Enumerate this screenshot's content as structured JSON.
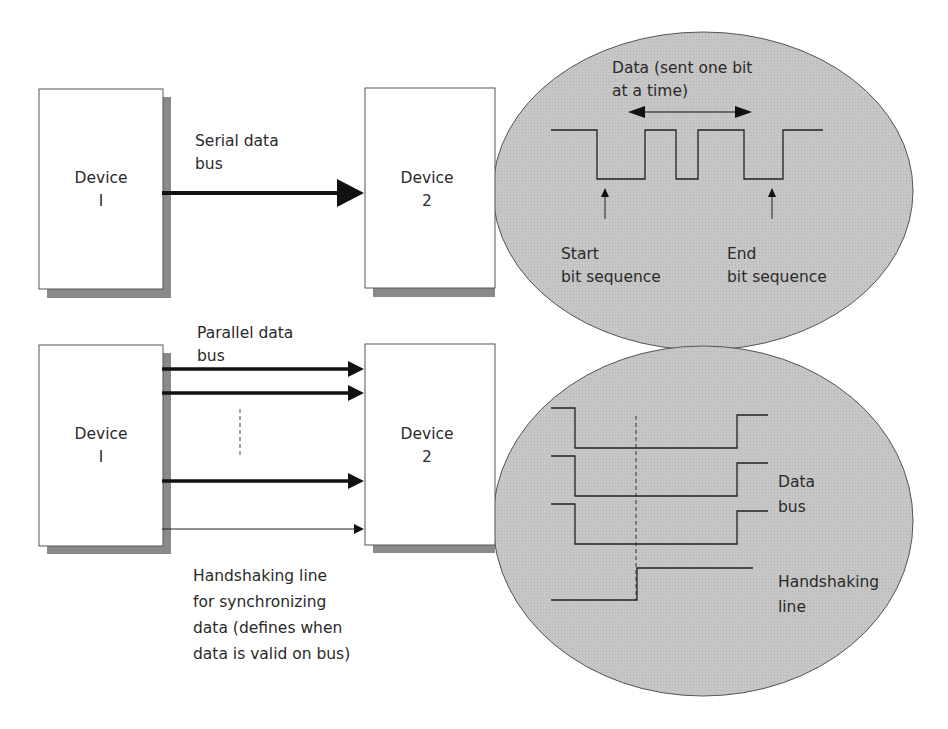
{
  "colors": {
    "ellipse_fill": "#c4c4c4",
    "ellipse_stroke": "#555555",
    "box_fill": "#ffffff",
    "box_stroke": "#555555",
    "shadow": "#888888",
    "line": "#1a1a1a"
  },
  "serial": {
    "device1": {
      "line1": "Device",
      "line2": "I"
    },
    "device2": {
      "line1": "Device",
      "line2": "2"
    },
    "bus_label": {
      "line1": "Serial data",
      "line2": "bus"
    },
    "callout": {
      "data_label": {
        "line1": "Data (sent one bit",
        "line2": "at a time)"
      },
      "start_label": {
        "line1": "Start",
        "line2": "bit sequence"
      },
      "end_label": {
        "line1": "End",
        "line2": "bit sequence"
      }
    }
  },
  "parallel": {
    "device1": {
      "line1": "Device",
      "line2": "I"
    },
    "device2": {
      "line1": "Device",
      "line2": "2"
    },
    "bus_label": {
      "line1": "Parallel data",
      "line2": "bus"
    },
    "handshake_label": {
      "line1": "Handshaking line",
      "line2": "for synchronizing",
      "line3": "data (defines when",
      "line4": "data is valid on bus)"
    },
    "callout": {
      "data_bus_label": {
        "line1": "Data",
        "line2": "bus"
      },
      "handshaking_label": {
        "line1": "Handshaking",
        "line2": "line"
      }
    }
  }
}
